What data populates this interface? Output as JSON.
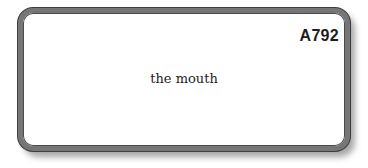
{
  "card": {
    "code": "A792",
    "text": "the mouth"
  }
}
